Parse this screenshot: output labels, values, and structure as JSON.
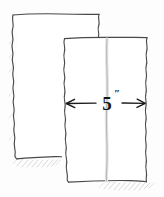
{
  "figure": {
    "background_color": "#fdfdfd",
    "ink_color": "#4a4a4a",
    "dimension_color": "#1d1d1d",
    "crease_color": "#b9b9b9",
    "shadow_color": "#cfcfcf"
  },
  "sheets": [
    {
      "name": "back-sheet",
      "label": "back sheet",
      "edges": {
        "top": "straight",
        "left": "torn",
        "right": "torn",
        "bottom": "straight"
      },
      "has_shadow": true
    },
    {
      "name": "front-sheet",
      "label": "front sheet",
      "edges": {
        "top": "straight",
        "left": "torn",
        "right": "torn",
        "bottom": "straight"
      },
      "has_crease": true,
      "has_shadow": true
    }
  ],
  "dimension": {
    "name": "width-dimension",
    "value": "5",
    "unit": "″",
    "full_label": "5″",
    "measures": "front-sheet-width",
    "arrow_style": "double-headed",
    "orientation": "horizontal"
  }
}
